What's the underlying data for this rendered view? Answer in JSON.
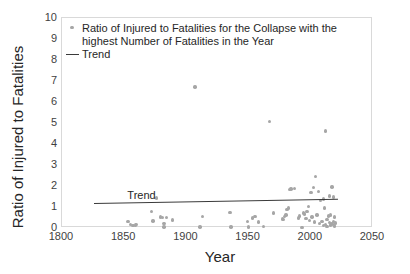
{
  "chart_data": {
    "type": "scatter",
    "title": "",
    "xlabel": "Year",
    "ylabel": "Ratio of Injured to Fatalities",
    "xlim": [
      1800,
      2050
    ],
    "ylim": [
      0,
      10
    ],
    "xticks": [
      1800,
      1850,
      1900,
      1950,
      2000,
      2050
    ],
    "yticks": [
      0,
      1,
      2,
      3,
      4,
      5,
      6,
      7,
      8,
      9,
      10
    ],
    "grid": false,
    "legend_position": "top-left",
    "series": [
      {
        "name": "Ratio of Injured to Fatalities for the Collapse with the highest Number of Fatalities in the Year",
        "marker": "circle",
        "color": "#a6a6a6",
        "points": [
          [
            1853,
            0.3
          ],
          [
            1855,
            0.18
          ],
          [
            1857,
            0.12
          ],
          [
            1859,
            0.14
          ],
          [
            1860,
            0.16
          ],
          [
            1872,
            0.78
          ],
          [
            1873,
            0.33
          ],
          [
            1876,
            1.42
          ],
          [
            1879,
            0.53
          ],
          [
            1881,
            0.5
          ],
          [
            1882,
            0.05
          ],
          [
            1882,
            0.22
          ],
          [
            1884,
            0.5
          ],
          [
            1889,
            0.38
          ],
          [
            1907,
            6.72
          ],
          [
            1911,
            0.05
          ],
          [
            1913,
            0.56
          ],
          [
            1935,
            0.73
          ],
          [
            1936,
            0.04
          ],
          [
            1949,
            0.3
          ],
          [
            1950,
            0.04
          ],
          [
            1953,
            0.48
          ],
          [
            1955,
            0.55
          ],
          [
            1958,
            0.28
          ],
          [
            1962,
            0.08
          ],
          [
            1967,
            5.08
          ],
          [
            1970,
            0.72
          ],
          [
            1977,
            0.42
          ],
          [
            1978,
            0.4
          ],
          [
            1979,
            0.55
          ],
          [
            1980,
            0.62
          ],
          [
            1981,
            0.88
          ],
          [
            1982,
            0.95
          ],
          [
            1983,
            1.82
          ],
          [
            1984,
            1.86
          ],
          [
            1987,
            1.88
          ],
          [
            1990,
            0.48
          ],
          [
            1991,
            0.58
          ],
          [
            1993,
            0.02
          ],
          [
            1994,
            0.72
          ],
          [
            1995,
            0.66
          ],
          [
            1996,
            0.45
          ],
          [
            1997,
            0.8
          ],
          [
            1998,
            1.02
          ],
          [
            1999,
            0.35
          ],
          [
            2000,
            1.7
          ],
          [
            2001,
            0.52
          ],
          [
            2002,
            1.92
          ],
          [
            2003,
            0.28
          ],
          [
            2004,
            2.45
          ],
          [
            2005,
            0.62
          ],
          [
            2006,
            1.75
          ],
          [
            2007,
            0.22
          ],
          [
            2008,
            1.3
          ],
          [
            2009,
            0.3
          ],
          [
            2010,
            1.38
          ],
          [
            2010,
            0.12
          ],
          [
            2011,
            0.95
          ],
          [
            2012,
            0.18
          ],
          [
            2012,
            4.62
          ],
          [
            2013,
            0.4
          ],
          [
            2013,
            0.08
          ],
          [
            2014,
            0.58
          ],
          [
            2015,
            0.25
          ],
          [
            2015,
            1.52
          ],
          [
            2016,
            0.14
          ],
          [
            2016,
            0.62
          ],
          [
            2017,
            1.95
          ],
          [
            2017,
            0.2
          ],
          [
            2018,
            0.3
          ],
          [
            2018,
            1.48
          ],
          [
            2019,
            0.1
          ],
          [
            2019,
            0.52
          ],
          [
            2020,
            0.24
          ]
        ]
      }
    ],
    "trend": {
      "name": "Trend",
      "color": "#3a3a3a",
      "x_start": 1826,
      "y_start": 1.18,
      "x_end": 2022,
      "y_end": 1.38,
      "inline_label": "Trend"
    }
  },
  "legend": {
    "entries": [
      {
        "marker": "dot",
        "label": "Ratio of Injured to Fatalities for the Collapse with the highest Number of Fatalities in the Year"
      },
      {
        "marker": "dash",
        "label": "Trend"
      }
    ]
  },
  "axes": {
    "x_title": "Year",
    "y_title": "Ratio of Injured to Fatalities",
    "x_tick_labels": [
      "1800",
      "1850",
      "1900",
      "1950",
      "2000",
      "2050"
    ],
    "y_tick_labels": [
      "0",
      "1",
      "2",
      "3",
      "4",
      "5",
      "6",
      "7",
      "8",
      "9",
      "10"
    ]
  },
  "colors": {
    "marker": "#a6a6a6",
    "trend": "#3a3a3a",
    "frame": "#d9d9d9",
    "text": "#262626",
    "background": "#ffffff"
  }
}
